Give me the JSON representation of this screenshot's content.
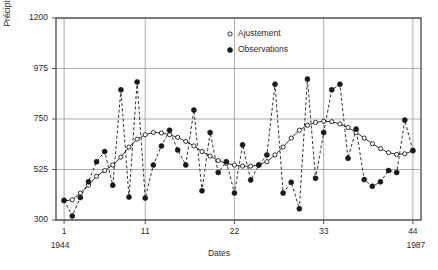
{
  "chart_data": {
    "type": "line",
    "title": "",
    "xlabel": "Dates",
    "ylabel": "Précipitations (mm)",
    "xlim": [
      0.0,
      45.0
    ],
    "ylim": [
      300,
      1200
    ],
    "grid": true,
    "legend_position": "top-right",
    "x_tick_labels": [
      "1",
      "11",
      "22",
      "33",
      "44"
    ],
    "x_tick_values": [
      1,
      11,
      22,
      33,
      44
    ],
    "y_tick_labels": [
      "300",
      "525",
      "750",
      "975",
      "1200"
    ],
    "y_tick_values": [
      300,
      525,
      750,
      975,
      1200
    ],
    "x_start_year": "1944",
    "x_end_year": "1987",
    "x": [
      1,
      2,
      3,
      4,
      5,
      6,
      7,
      8,
      9,
      10,
      11,
      12,
      13,
      14,
      15,
      16,
      17,
      18,
      19,
      20,
      21,
      22,
      23,
      24,
      25,
      26,
      27,
      28,
      29,
      30,
      31,
      32,
      33,
      34,
      35,
      36,
      37,
      38,
      39,
      40,
      41,
      42,
      43,
      44
    ],
    "series": [
      {
        "name": "Observations",
        "marker": "filled-circle",
        "linestyle": "dashed",
        "values": [
          388,
          318,
          400,
          470,
          560,
          605,
          455,
          880,
          402,
          915,
          398,
          545,
          630,
          700,
          612,
          545,
          790,
          430,
          690,
          512,
          560,
          420,
          635,
          478,
          545,
          590,
          905,
          420,
          468,
          350,
          928,
          486,
          690,
          880,
          905,
          575,
          705,
          480,
          450,
          470,
          520,
          512,
          745,
          610
        ]
      },
      {
        "name": "Ajustement",
        "marker": "open-circle",
        "linestyle": "solid",
        "values": [
          385,
          390,
          420,
          455,
          495,
          520,
          545,
          580,
          625,
          660,
          680,
          690,
          688,
          680,
          668,
          650,
          630,
          605,
          585,
          565,
          552,
          545,
          540,
          540,
          545,
          560,
          590,
          625,
          665,
          700,
          722,
          735,
          740,
          738,
          728,
          712,
          690,
          665,
          640,
          618,
          600,
          592,
          595,
          608
        ]
      }
    ]
  },
  "legend": {
    "items": [
      {
        "label": "Ajustement",
        "marker": "open-circle"
      },
      {
        "label": "Observations",
        "marker": "filled-circle"
      }
    ]
  },
  "colors": {
    "line": "#1a1a1a",
    "grid": "#8a8a8a",
    "frame": "#555555",
    "text": "#2b2b2b",
    "background": "#ffffff"
  }
}
